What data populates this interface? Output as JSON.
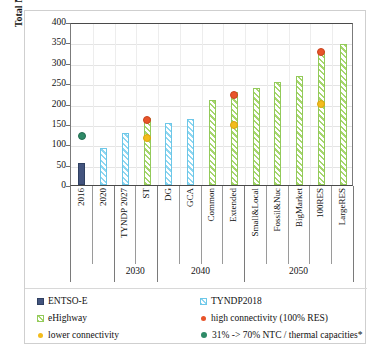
{
  "chart_data": {
    "type": "bar",
    "title": "",
    "xlabel": "",
    "ylabel": "Total NTC [GW]",
    "ylim": [
      0,
      400
    ],
    "yticks": [
      0,
      50,
      100,
      150,
      200,
      250,
      300,
      350,
      400
    ],
    "grid": true,
    "legend_position": "bottom",
    "categories": [
      "2016",
      "2020",
      "TYNDP 2027",
      "ST",
      "DG",
      "GCA",
      "Common",
      "Extended",
      "Small&Local",
      "Fossil&Nuc",
      "BigMarket",
      "100RES",
      "LargeRES"
    ],
    "category_groups": [
      {
        "label": "",
        "categories": [
          "2016",
          "2020"
        ]
      },
      {
        "label": "2030",
        "categories": [
          "TYNDP 2027",
          "ST"
        ]
      },
      {
        "label": "2040",
        "categories": [
          "DG",
          "GCA",
          "Common",
          "Extended"
        ]
      },
      {
        "label": "2050",
        "categories": [
          "Small&Local",
          "Fossil&Nuc",
          "BigMarket",
          "100RES",
          "LargeRES"
        ]
      }
    ],
    "series": [
      {
        "name": "ENTSO-E",
        "type": "bar",
        "color": "#43547e",
        "values": [
          55,
          null,
          null,
          null,
          null,
          null,
          null,
          null,
          null,
          null,
          null,
          null,
          null
        ]
      },
      {
        "name": "TYNDP2018",
        "type": "bar",
        "color": "#8ed6f0",
        "values": [
          null,
          92,
          128,
          null,
          152,
          162,
          null,
          null,
          null,
          null,
          null,
          null,
          null
        ]
      },
      {
        "name": "eHighway",
        "type": "bar",
        "color": "#a6d66d",
        "values": [
          null,
          null,
          null,
          165,
          null,
          null,
          208,
          228,
          237,
          252,
          268,
          330,
          345
        ]
      },
      {
        "name": "high connectivity (100% RES)",
        "type": "scatter",
        "color": "#e8542a",
        "values": [
          null,
          null,
          null,
          167,
          null,
          null,
          null,
          228,
          null,
          null,
          null,
          333,
          null
        ]
      },
      {
        "name": "lower connectivity",
        "type": "scatter",
        "color": "#f3bc1c",
        "values": [
          null,
          null,
          null,
          122,
          null,
          null,
          null,
          155,
          null,
          null,
          null,
          207,
          null
        ]
      },
      {
        "name": "31% -> 70% NTC / thermal capacities*",
        "type": "scatter",
        "color": "#2e8a67",
        "values": [
          128,
          null,
          null,
          null,
          null,
          null,
          null,
          null,
          null,
          null,
          null,
          null,
          null
        ]
      }
    ]
  },
  "axis": {
    "y_title": "Total NTC [GW]",
    "y_labels": [
      "400",
      "350",
      "300",
      "250",
      "200",
      "150",
      "100",
      "50",
      "0"
    ],
    "x_categories": [
      "2016",
      "2020",
      "TYNDP 2027",
      "ST",
      "DG",
      "GCA",
      "Common",
      "Extended",
      "Small&Local",
      "Fossil&Nuc",
      "BigMarket",
      "100RES",
      "LargeRES"
    ],
    "x_groups": [
      "2030",
      "2040",
      "2050"
    ]
  },
  "legend": {
    "entsoe": "ENTSO-E",
    "tyndp": "TYNDP2018",
    "ehighway": "eHighway",
    "high_connectivity": "high connectivity (100% RES)",
    "lower_connectivity": "lower connectivity",
    "ntc_thermal": "31% -> 70% NTC / thermal capacities*"
  }
}
